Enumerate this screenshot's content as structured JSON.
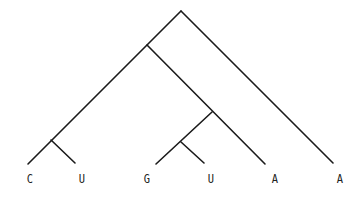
{
  "diagram": {
    "type": "phylogenetic-tree",
    "nodes": [
      {
        "id": "root",
        "x": 181,
        "y": 11
      },
      {
        "id": "n1",
        "x": 147,
        "y": 45
      },
      {
        "id": "n2",
        "x": 212,
        "y": 112
      },
      {
        "id": "n3",
        "x": 181,
        "y": 142
      },
      {
        "id": "n4",
        "x": 51,
        "y": 140
      }
    ],
    "leaves": [
      {
        "id": "leaf-c",
        "label": "C",
        "x": 28,
        "y": 164,
        "label_x": 30
      },
      {
        "id": "leaf-u1",
        "label": "U",
        "x": 75,
        "y": 163,
        "label_x": 82
      },
      {
        "id": "leaf-g",
        "label": "G",
        "x": 156,
        "y": 164,
        "label_x": 147
      },
      {
        "id": "leaf-u2",
        "label": "U",
        "x": 204,
        "y": 163,
        "label_x": 211
      },
      {
        "id": "leaf-a1",
        "label": "A",
        "x": 265,
        "y": 164,
        "label_x": 275
      },
      {
        "id": "leaf-a2",
        "label": "A",
        "x": 333,
        "y": 163,
        "label_x": 340
      }
    ],
    "edges": [
      [
        "root",
        "leaf-a2"
      ],
      [
        "root",
        "leaf-c"
      ],
      [
        "n1",
        "leaf-a1"
      ],
      [
        "n2",
        "leaf-g"
      ],
      [
        "n3",
        "leaf-u2"
      ],
      [
        "n4",
        "leaf-u1"
      ]
    ],
    "label_y": 172
  }
}
